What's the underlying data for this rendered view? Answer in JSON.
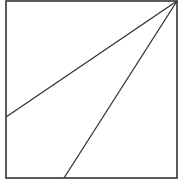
{
  "diagram": {
    "width": 181,
    "height": 185,
    "stroke_color": "#333333",
    "background": "#ffffff",
    "square": {
      "x": 6,
      "y": 1,
      "width": 171,
      "height": 177
    },
    "lines": [
      {
        "name": "line-to-left-edge",
        "x1": 177,
        "y1": 1,
        "x2": 6,
        "y2": 117
      },
      {
        "name": "line-to-bottom-edge",
        "x1": 177,
        "y1": 1,
        "x2": 64,
        "y2": 178
      }
    ]
  }
}
